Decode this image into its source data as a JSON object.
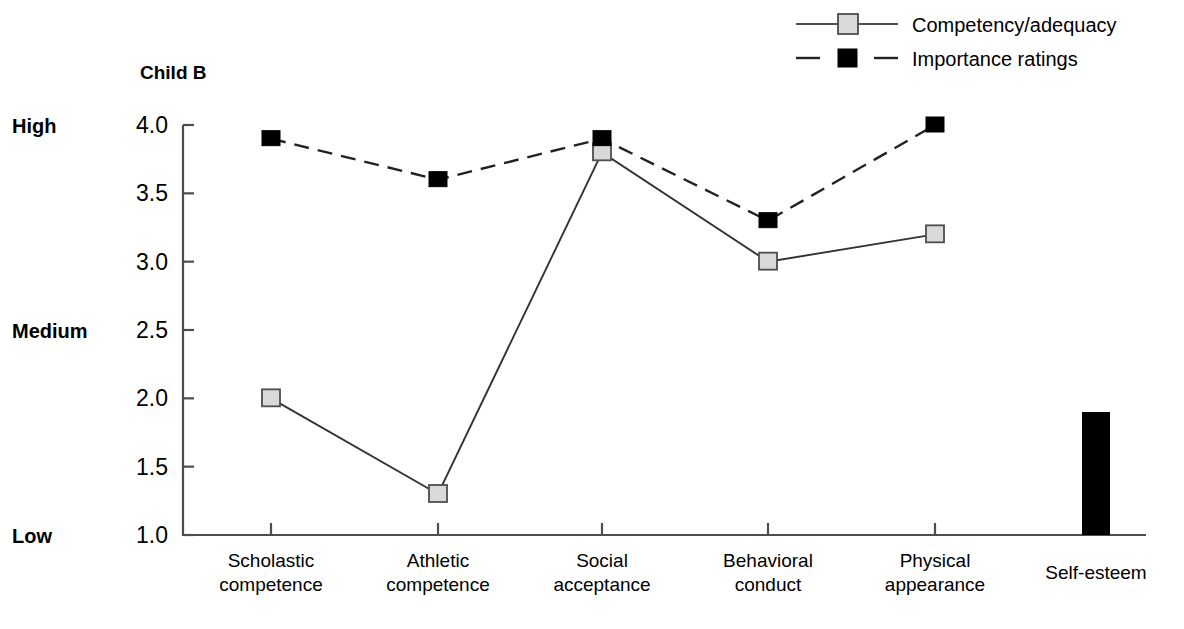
{
  "chart_data": {
    "type": "line",
    "title": "Child B",
    "xlabel": "",
    "ylabel": "",
    "ylim": [
      1.0,
      4.0
    ],
    "grid": false,
    "legend_position": "top-right",
    "categories": [
      "Scholastic competence",
      "Athletic competence",
      "Social acceptance",
      "Behavioral conduct",
      "Physical appearance"
    ],
    "category_lines": [
      [
        "Scholastic",
        "competence"
      ],
      [
        "Athletic",
        "competence"
      ],
      [
        "Social",
        "acceptance"
      ],
      [
        "Behavioral",
        "conduct"
      ],
      [
        "Physical",
        "appearance"
      ]
    ],
    "series": [
      {
        "name": "Competency/adequacy",
        "marker": "open-square",
        "line": "solid",
        "values": [
          2.0,
          1.3,
          3.8,
          3.0,
          3.2
        ]
      },
      {
        "name": "Importance ratings",
        "marker": "filled-square",
        "line": "dashed",
        "values": [
          3.9,
          3.6,
          3.9,
          3.3,
          4.0
        ]
      }
    ],
    "extra_bar": {
      "label": "Self-esteem",
      "value": 1.9,
      "color": "#000000"
    },
    "ytick_labels": [
      "4.0",
      "3.5",
      "3.0",
      "2.5",
      "2.0",
      "1.5",
      "1.0"
    ],
    "ytick_values": [
      4.0,
      3.5,
      3.0,
      2.5,
      2.0,
      1.5,
      1.0
    ],
    "yband_labels": [
      {
        "text": "High",
        "value": 4.0
      },
      {
        "text": "Medium",
        "value": 2.5
      },
      {
        "text": "Low",
        "value": 1.0
      }
    ],
    "colors": {
      "competency_marker_fill": "#d9d9d9",
      "competency_line": "#333333",
      "importance_marker_fill": "#000000",
      "importance_line": "#222222",
      "axis": "#4d4d4d",
      "bar": "#000000",
      "background": "#ffffff"
    }
  },
  "legend": {
    "items": [
      {
        "label": "Competency/adequacy"
      },
      {
        "label": "Importance ratings"
      }
    ]
  }
}
